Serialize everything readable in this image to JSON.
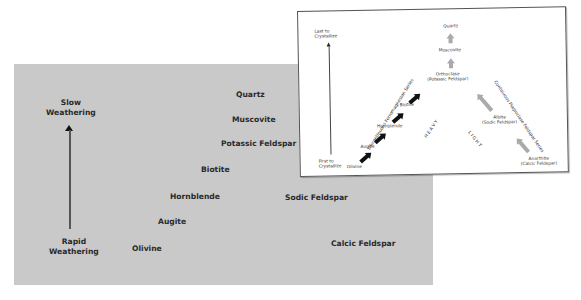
{
  "weathering_chart": {
    "axis_top": [
      "Slow",
      "Weathering"
    ],
    "axis_bottom": [
      "Rapid",
      "Weathering"
    ],
    "minerals": {
      "quartz": "Quartz",
      "muscovite": "Muscovite",
      "potassic_feldspar": "Potassic Feldspar",
      "biotite": "Biotite",
      "hornblende": "Hornblende",
      "augite": "Augite",
      "olivine": "Olivine",
      "sodic_feldspar": "Sodic Feldspar",
      "calcic_feldspar": "Calcic Feldspar"
    },
    "colors": {
      "panel": "#c9c9c9",
      "text": "#2a2a2a"
    }
  },
  "bowen_inset": {
    "axis_top": [
      "Last to",
      "Crystallize"
    ],
    "axis_bottom": [
      "First to",
      "Crystallize"
    ],
    "quartz": "Quartz",
    "muscovite": "Muscovite",
    "orthoclase": [
      "Orthoclase",
      "(Potassic Feldspar)"
    ],
    "biotite": "Biotite",
    "hornblende": "Hornblende",
    "augite": "Augite",
    "olivine": "Olivine",
    "albite": [
      "Albite",
      "(Sodic Feldspar)"
    ],
    "anorthite": [
      "Anorthite",
      "(Calcic Feldspar)"
    ],
    "discontinuous_series": "Discontinuous Ferromagnesian Series",
    "continuous_series": "Continuous Plagioclase Feldspar Series",
    "heavy": "H E A V Y",
    "light": "L I G H T",
    "colors": {
      "dark_arrow": "#111111",
      "light_arrow": "#aaaaaa",
      "border": "#555555"
    }
  }
}
